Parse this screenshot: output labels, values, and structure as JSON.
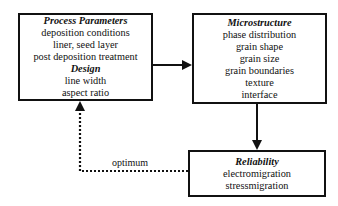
{
  "nodes": {
    "process": {
      "title": "Process Parameters",
      "items": [
        "deposition conditions",
        "liner, seed layer",
        "post deposition treatment"
      ],
      "subtitle": "Design",
      "sub_items": [
        "line width",
        "aspect ratio"
      ]
    },
    "microstructure": {
      "title": "Microstructure",
      "items": [
        "phase distribution",
        "grain shape",
        "grain size",
        "grain boundaries",
        "texture",
        "interface"
      ]
    },
    "reliability": {
      "title": "Reliability",
      "items": [
        "electromigration",
        "stressmigration"
      ]
    }
  },
  "edges": [
    {
      "from": "process",
      "to": "microstructure",
      "style": "solid"
    },
    {
      "from": "microstructure",
      "to": "reliability",
      "style": "solid"
    },
    {
      "from": "reliability",
      "to": "process",
      "style": "dotted",
      "label": "optimum"
    }
  ]
}
